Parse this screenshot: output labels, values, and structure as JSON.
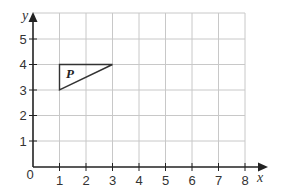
{
  "diagram": {
    "type": "coordinate-grid",
    "axes": {
      "x": {
        "label": "x",
        "min": 0,
        "max": 8,
        "ticks": [
          "1",
          "2",
          "3",
          "4",
          "5",
          "6",
          "7",
          "8"
        ]
      },
      "y": {
        "label": "y",
        "min": 0,
        "max": 6,
        "ticks": [
          "1",
          "2",
          "3",
          "4",
          "5"
        ]
      },
      "origin_label": "0"
    },
    "shapes": [
      {
        "name": "P",
        "label": "P",
        "type": "triangle",
        "vertices": [
          [
            1,
            4
          ],
          [
            3,
            4
          ],
          [
            1,
            3
          ]
        ]
      }
    ],
    "colors": {
      "grid": "#c8c8c8",
      "axis": "#222222",
      "shape": "#333333"
    }
  }
}
